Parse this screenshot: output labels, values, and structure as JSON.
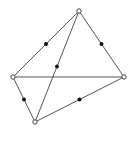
{
  "diagram": {
    "type": "graph",
    "background": "#ffffff",
    "line_color": "#555555",
    "vertex_style": "hollow-circle",
    "midpoint_style": "filled-dot",
    "vertices": [
      {
        "id": "top",
        "x": 79,
        "y": 11
      },
      {
        "id": "left",
        "x": 13,
        "y": 77
      },
      {
        "id": "right",
        "x": 124,
        "y": 77
      },
      {
        "id": "bottom",
        "x": 35,
        "y": 122
      }
    ],
    "edges": [
      {
        "from": "top",
        "to": "left",
        "midpoint": true
      },
      {
        "from": "top",
        "to": "right",
        "midpoint": true
      },
      {
        "from": "top",
        "to": "bottom",
        "midpoint": true
      },
      {
        "from": "left",
        "to": "right",
        "midpoint": false
      },
      {
        "from": "left",
        "to": "bottom",
        "midpoint": true
      },
      {
        "from": "bottom",
        "to": "right",
        "midpoint": true
      }
    ]
  }
}
